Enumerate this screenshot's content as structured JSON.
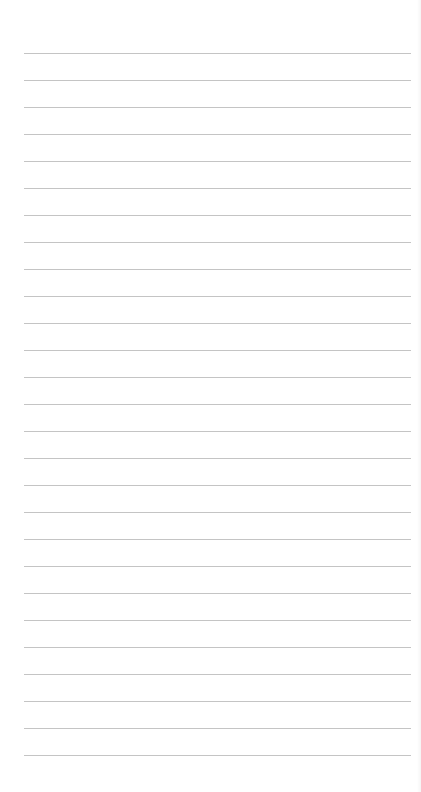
{
  "page": {
    "type": "blank lined paper",
    "background_color": "#ffffff",
    "line_color": "#c4c4c4",
    "line_count": 27,
    "first_line_y": 53,
    "line_spacing": 27,
    "line_left": 24,
    "line_right": 411
  }
}
